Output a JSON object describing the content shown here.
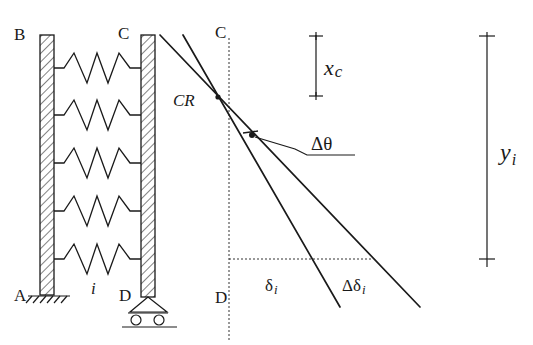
{
  "figure": {
    "type": "structural mechanics schematic",
    "colors": {
      "ink": "#1a1a1a",
      "background": "#ffffff"
    }
  },
  "labels": {
    "left_wall_top": "B",
    "left_wall_bottom": "A",
    "right_wall_top": "C",
    "right_wall_bottom": "D",
    "spring_index": "i",
    "deflected_top": "C",
    "deflected_bottom": "D",
    "center_of_rigidity": "CR",
    "rotation_increment": "Δθ",
    "delta_i_symbol": "δ",
    "delta_i_sub": "i",
    "delta_delta_i_symbol": "Δδ",
    "delta_delta_i_sub": "i",
    "xc_symbol": "x",
    "xc_sub": "c",
    "yi_symbol": "y",
    "yi_sub": "i"
  },
  "elements": {
    "springs_count": 5,
    "left_support": "fixed",
    "right_support": "roller",
    "lines": [
      "deflected shape δ_i",
      "incremented shape δ_i + Δδ_i"
    ]
  }
}
